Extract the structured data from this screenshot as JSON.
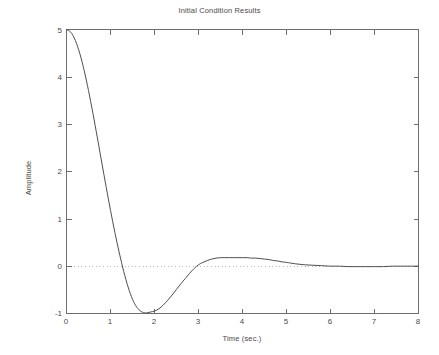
{
  "chart_data": {
    "type": "line",
    "title": "Initial Condition Results",
    "xlabel": "Time (sec.)",
    "ylabel": "Amplitude",
    "xlim": [
      0,
      8
    ],
    "ylim": [
      -1,
      5
    ],
    "xticks": [
      "0",
      "1",
      "2",
      "3",
      "4",
      "5",
      "6",
      "7",
      "8"
    ],
    "xtick_values": [
      0,
      1,
      2,
      3,
      4,
      5,
      6,
      7,
      8
    ],
    "yticks": [
      "-1",
      "0",
      "1",
      "2",
      "3",
      "4",
      "5"
    ],
    "ytick_values": [
      -1,
      0,
      1,
      2,
      3,
      4,
      5
    ],
    "grid": false,
    "legend": null,
    "zero_reference_line": {
      "value": 0,
      "style": "dotted",
      "color": "#b9b9b9"
    },
    "series": [
      {
        "name": "Initial condition response",
        "color": "#4f4f4f",
        "x": [
          0,
          0.1,
          0.2,
          0.3,
          0.4,
          0.5,
          0.6,
          0.7,
          0.8,
          0.9,
          1.0,
          1.1,
          1.2,
          1.3,
          1.4,
          1.5,
          1.6,
          1.7,
          1.8,
          1.9,
          2.0,
          2.1,
          2.2,
          2.3,
          2.4,
          2.5,
          2.6,
          2.7,
          2.8,
          2.9,
          3.0,
          3.1,
          3.2,
          3.3,
          3.4,
          3.5,
          3.6,
          3.7,
          3.8,
          3.9,
          4.0,
          4.1,
          4.2,
          4.3,
          4.4,
          4.5,
          4.6,
          4.7,
          4.8,
          4.9,
          5.0,
          5.2,
          5.4,
          5.6,
          5.8,
          6.0,
          6.2,
          6.4,
          6.6,
          6.8,
          7.0,
          7.2,
          7.4,
          7.6,
          7.8,
          8.0
        ],
        "y": [
          5.0,
          4.94,
          4.77,
          4.5,
          4.14,
          3.71,
          3.23,
          2.72,
          2.2,
          1.68,
          1.18,
          0.71,
          0.28,
          -0.11,
          -0.44,
          -0.7,
          -0.87,
          -0.96,
          -0.99,
          -0.97,
          -0.95,
          -0.9,
          -0.82,
          -0.72,
          -0.61,
          -0.49,
          -0.37,
          -0.26,
          -0.15,
          -0.05,
          0.03,
          0.08,
          0.12,
          0.15,
          0.17,
          0.18,
          0.18,
          0.18,
          0.18,
          0.18,
          0.18,
          0.18,
          0.17,
          0.17,
          0.16,
          0.15,
          0.14,
          0.12,
          0.11,
          0.09,
          0.08,
          0.05,
          0.03,
          0.02,
          0.01,
          0.0,
          0.0,
          -0.01,
          -0.01,
          -0.01,
          -0.01,
          -0.01,
          0.0,
          0.0,
          0.0,
          0.0
        ],
        "annotations": {
          "initial_value": 5,
          "undershoot_min": -0.96,
          "undershoot_time": 2.05,
          "overshoot_max": 0.18,
          "overshoot_time": 4.3,
          "first_zero_crossing": 1.25,
          "final_value": 0
        }
      }
    ]
  },
  "figure": {
    "background_color": "#ffffff",
    "axis_color": "#6e6e6e",
    "text_color": "#4a4a4a"
  }
}
